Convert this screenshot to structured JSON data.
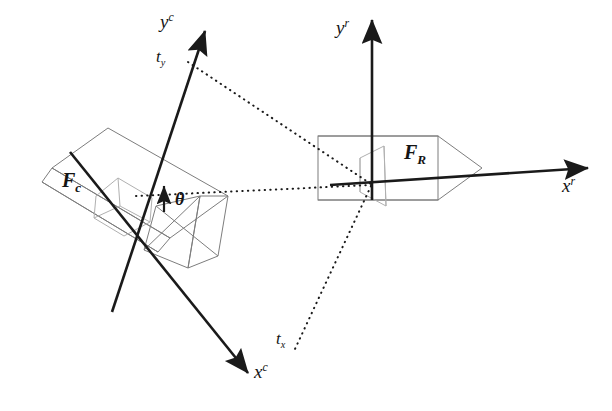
{
  "figure": {
    "background_color": "#ffffff",
    "width": 612,
    "height": 411
  },
  "colors": {
    "axis_stroke": "#1a1a1a",
    "body_stroke": "#7d7d7d",
    "lens_stroke": "#b0b0b0",
    "dotted_stroke": "#1a1a1a",
    "text": "#141414"
  },
  "camera_frame": {
    "name": "camera-frame",
    "label": "F",
    "label_sub": "c",
    "origin": [
      150,
      200
    ],
    "axes": [
      {
        "name": "camera-y-axis",
        "label": "y",
        "superscript": "c",
        "from": [
          112,
          310
        ],
        "to": [
          206,
          29
        ],
        "label_pos": [
          162,
          8
        ]
      },
      {
        "name": "camera-x-axis",
        "label": "x",
        "superscript": "c",
        "from": [
          70,
          152
        ],
        "to": [
          250,
          376
        ],
        "label_pos": [
          253,
          370
        ]
      }
    ],
    "angle": {
      "name": "theta-angle",
      "label": "θ",
      "label_pos": [
        175,
        188
      ]
    }
  },
  "robot_frame": {
    "name": "robot-frame",
    "label": "F",
    "label_sub": "R",
    "origin": [
      372,
      185
    ],
    "axes": [
      {
        "name": "robot-y-axis",
        "label": "y",
        "superscript": "r",
        "from": [
          372,
          200
        ],
        "to": [
          372,
          18
        ],
        "label_pos": [
          340,
          15
        ]
      },
      {
        "name": "robot-x-axis",
        "label": "x",
        "superscript": "r",
        "from": [
          330,
          185
        ],
        "to": [
          592,
          168
        ],
        "label_pos": [
          560,
          180
        ]
      }
    ]
  },
  "translations": [
    {
      "name": "translation-ty",
      "label": "t",
      "subscript": "y",
      "label_pos": [
        158,
        46
      ],
      "line_from": [
        188,
        62
      ],
      "line_to": [
        372,
        185
      ]
    },
    {
      "name": "translation-tx",
      "label": "t",
      "subscript": "x",
      "label_pos": [
        276,
        328
      ],
      "line_from": [
        372,
        185
      ],
      "line_to": [
        296,
        348
      ]
    }
  ],
  "dotted_lines": [
    {
      "name": "dotted-line-ty-to-robot",
      "from": [
        188,
        62
      ],
      "to": [
        372,
        185
      ]
    },
    {
      "name": "dotted-line-camera-to-robot",
      "from": [
        137,
        196
      ],
      "to": [
        372,
        185
      ]
    },
    {
      "name": "dotted-line-robot-to-tx",
      "from": [
        372,
        185
      ],
      "to": [
        296,
        348
      ]
    }
  ]
}
